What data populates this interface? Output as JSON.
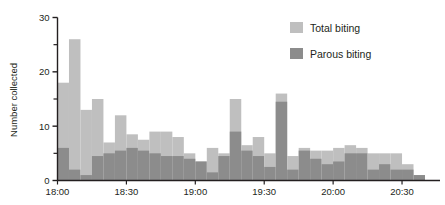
{
  "chart_data": {
    "type": "bar",
    "subtype": "stacked-bar-time-series",
    "title": "",
    "xlabel": "",
    "ylabel": "Number collected",
    "ylim": [
      0,
      30
    ],
    "yticks": [
      0,
      10,
      20,
      30
    ],
    "yticklabels": [
      "0",
      "10",
      "20",
      "30"
    ],
    "yminorticks": [
      5,
      15,
      25
    ],
    "xlim": [
      "18:00",
      "20:45"
    ],
    "xticks": [
      "18:00",
      "18:30",
      "19:00",
      "19:30",
      "20:00",
      "20:30"
    ],
    "xticklabels": [
      "18:00",
      "18:30",
      "19:00",
      "19:30",
      "20:00",
      "20:30"
    ],
    "grid": false,
    "legend_position": "top-right",
    "bin_minutes": 5,
    "x": [
      "18:00",
      "18:05",
      "18:10",
      "18:15",
      "18:20",
      "18:25",
      "18:30",
      "18:35",
      "18:40",
      "18:45",
      "18:50",
      "18:55",
      "19:00",
      "19:05",
      "19:10",
      "19:15",
      "19:20",
      "19:25",
      "19:30",
      "19:35",
      "19:40",
      "19:45",
      "19:50",
      "19:55",
      "20:00",
      "20:05",
      "20:10",
      "20:15",
      "20:20",
      "20:25",
      "20:30",
      "20:35"
    ],
    "series": [
      {
        "name": "Total biting",
        "color": "#bfbfbf",
        "values": [
          18,
          26,
          13,
          15,
          7,
          12,
          8.5,
          7.5,
          9,
          9,
          8,
          5,
          3.5,
          6,
          5,
          15,
          6.5,
          8,
          5,
          16,
          4.5,
          6,
          5.5,
          5.5,
          6,
          6.5,
          6,
          5,
          5,
          5,
          3,
          1
        ]
      },
      {
        "name": "Parous biting",
        "color": "#8c8c8c",
        "values": [
          6,
          2,
          1,
          4.5,
          5,
          5.5,
          6,
          5.5,
          5,
          4.5,
          4.5,
          4,
          3.5,
          1.5,
          4.5,
          9,
          5.5,
          4.5,
          2.5,
          14.5,
          2,
          5.5,
          4,
          3,
          3.5,
          5,
          5,
          2,
          3,
          2,
          2,
          1
        ]
      }
    ]
  },
  "legend": {
    "entries": [
      {
        "label": "Total biting",
        "color": "#bfbfbf",
        "swatch": "legend-swatch-total"
      },
      {
        "label": "Parous biting",
        "color": "#8c8c8c",
        "swatch": "legend-swatch-parous"
      }
    ]
  },
  "axes": {
    "y_title": "Number collected",
    "y_labels": [
      "30",
      "20",
      "10",
      "0"
    ],
    "x_labels": [
      "18:00",
      "18:30",
      "19:00",
      "19:30",
      "20:00",
      "20:30"
    ]
  },
  "colors": {
    "total": "#bfbfbf",
    "parous": "#8c8c8c",
    "axis": "#231f20",
    "background": "#ffffff"
  }
}
